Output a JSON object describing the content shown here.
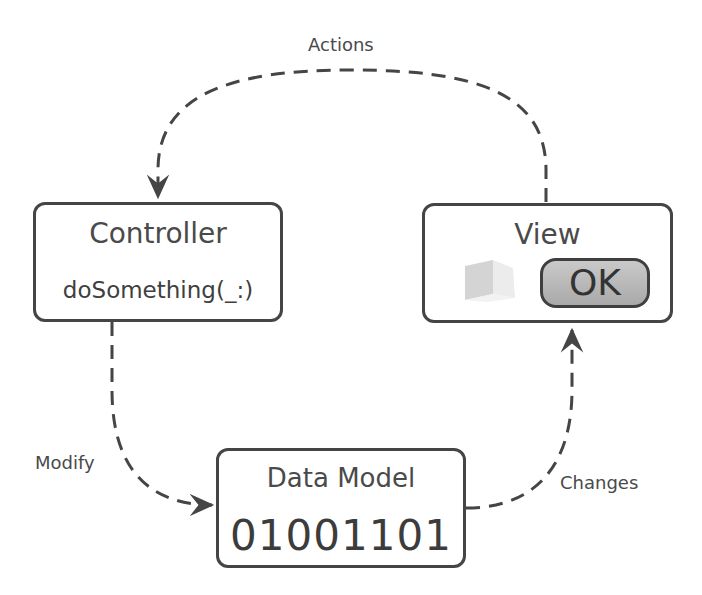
{
  "diagram": {
    "nodes": {
      "controller": {
        "title": "Controller",
        "method": "doSomething(_:)"
      },
      "view": {
        "title": "View",
        "button_label": "OK"
      },
      "data_model": {
        "title": "Data Model",
        "value": "01001101"
      }
    },
    "edges": {
      "actions": {
        "label": "Actions",
        "from": "View",
        "to": "Controller"
      },
      "modify": {
        "label": "Modify",
        "from": "Controller",
        "to": "Data Model"
      },
      "changes": {
        "label": "Changes",
        "from": "Data Model",
        "to": "View"
      }
    },
    "colors": {
      "stroke": "#454545",
      "text": "#4a4a4a",
      "button_fill": "#b9b9b9",
      "background": "#ffffff"
    }
  }
}
